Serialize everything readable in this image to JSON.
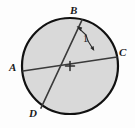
{
  "figure": {
    "name": "circle-with-two-intersecting-chords",
    "type": "geometry-diagram",
    "background_color": "#fdfdfd",
    "circle": {
      "fill_color": "#d9d9d9",
      "stroke_color": "#111111",
      "stroke_width": 2.2,
      "center_x": 70,
      "center_y": 66,
      "radius": 48
    },
    "center_mark": {
      "symbol": "+",
      "x": 70,
      "y": 66,
      "size": 9,
      "stroke_color": "#2b2b2b"
    },
    "points": [
      {
        "id": "A",
        "label": "A",
        "x": 23,
        "y": 71,
        "label_x": 9,
        "label_y": 62
      },
      {
        "id": "B",
        "label": "B",
        "x": 82,
        "y": 20,
        "label_x": 70,
        "label_y": 5
      },
      {
        "id": "C",
        "label": "C",
        "x": 117,
        "y": 57,
        "label_x": 119,
        "label_y": 47
      },
      {
        "id": "D",
        "label": "D",
        "x": 41,
        "y": 108,
        "label_x": 29,
        "label_y": 108
      }
    ],
    "chords": [
      {
        "id": "AC",
        "from": "A",
        "to": "C",
        "x1": 23,
        "y1": 71,
        "x2": 117,
        "y2": 57,
        "stroke_color": "#3a3a3a",
        "stroke_width": 1.7
      },
      {
        "id": "BD",
        "from": "B",
        "to": "D",
        "x1": 82,
        "y1": 20,
        "x2": 41,
        "y2": 108,
        "stroke_color": "#3a3a3a",
        "stroke_width": 1.7
      }
    ],
    "intersection": {
      "x": 63,
      "y": 66
    },
    "angle_marker": {
      "label": "1",
      "symbol": "∠",
      "full_label": "∠1",
      "label_x": 83,
      "label_y": 34,
      "arc_color": "#2b2b2b",
      "arrow_color": "#2b2b2b",
      "arrow_to_chord_bd": {
        "x": 77,
        "y": 27
      },
      "arrow_to_chord_ac": {
        "x": 94,
        "y": 50
      }
    }
  }
}
